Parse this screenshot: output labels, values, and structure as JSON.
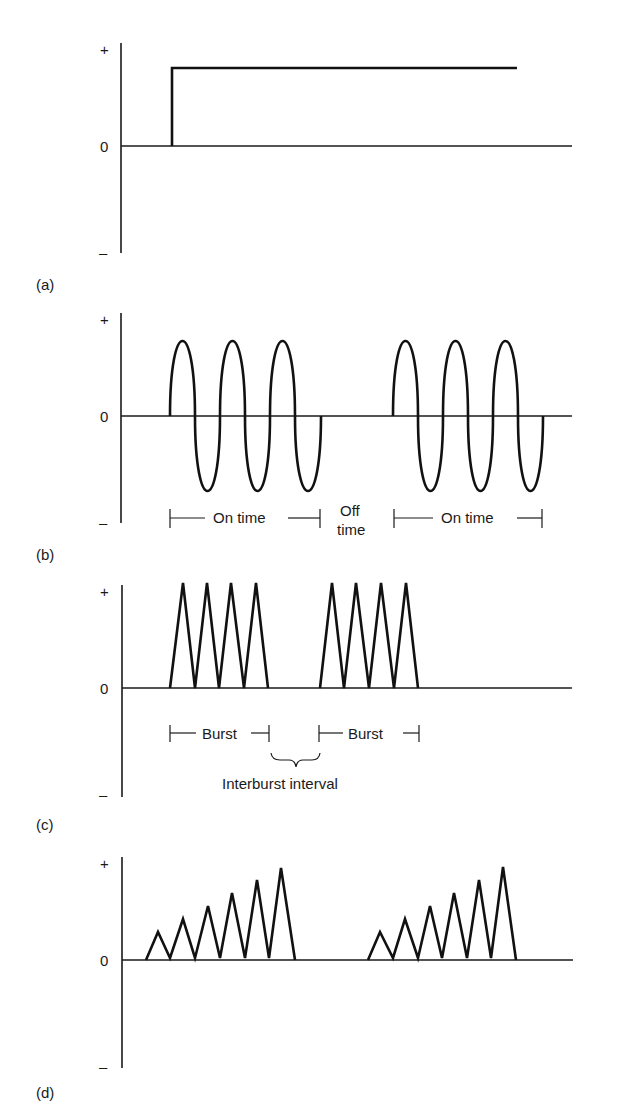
{
  "figure": {
    "axis_symbols": {
      "plus": "+",
      "zero": "0",
      "minus": "–"
    },
    "panels": [
      {
        "id": "a",
        "label": "(a)",
        "waveform": "monophasic-direct-current",
        "annotations": []
      },
      {
        "id": "b",
        "label": "(b)",
        "waveform": "biphasic-sine-bursts",
        "annotations": {
          "on_time_1": "On time",
          "off_time_line1": "Off",
          "off_time_line2": "time",
          "on_time_2": "On time"
        }
      },
      {
        "id": "c",
        "label": "(c)",
        "waveform": "monophasic-triangular-bursts",
        "annotations": {
          "burst_1": "Burst",
          "burst_2": "Burst",
          "interburst": "Interburst interval"
        }
      },
      {
        "id": "d",
        "label": "(d)",
        "waveform": "ramped-triangular-bursts",
        "annotations": []
      }
    ]
  },
  "colors": {
    "background": "#ffffff",
    "ink": "#111111"
  }
}
